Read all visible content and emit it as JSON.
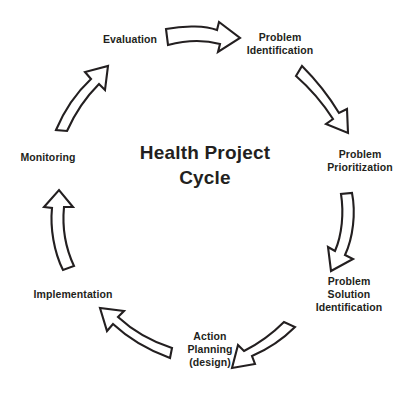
{
  "diagram": {
    "title_line1": "Health Project",
    "title_line2": "Cycle",
    "background_color": "#ffffff",
    "stroke_color": "#231f20",
    "text_color": "#231f20",
    "shape": "circular-cycle",
    "direction": "clockwise",
    "stage_count": 7,
    "arrow_count": 7,
    "stages": [
      {
        "id": "evaluation",
        "label": "Evaluation",
        "lines": [
          "Evaluation"
        ],
        "position": "top-left",
        "order": 7
      },
      {
        "id": "problem-identification",
        "label": "Problem Identification",
        "lines": [
          "Problem",
          "Identification"
        ],
        "position": "top-right",
        "order": 1
      },
      {
        "id": "problem-prioritization",
        "label": "Problem Prioritization",
        "lines": [
          "Problem",
          "Prioritization"
        ],
        "position": "right",
        "order": 2
      },
      {
        "id": "problem-solution-identification",
        "label": "Problem Solution Identification",
        "lines": [
          "Problem",
          "Solution",
          "Identification"
        ],
        "position": "bottom-right",
        "order": 3
      },
      {
        "id": "action-planning",
        "label": "Action Planning (design)",
        "lines": [
          "Action",
          "Planning",
          "(design)"
        ],
        "position": "bottom",
        "order": 4
      },
      {
        "id": "implementation",
        "label": "Implementation",
        "lines": [
          "Implementation"
        ],
        "position": "bottom-left",
        "order": 5
      },
      {
        "id": "monitoring",
        "label": "Monitoring",
        "lines": [
          "Monitoring"
        ],
        "position": "left",
        "order": 6
      }
    ],
    "arrows": [
      {
        "id": "arrow-evaluation-to-problem-identification",
        "from": "evaluation",
        "to": "problem-identification",
        "direction": "right"
      },
      {
        "id": "arrow-problem-identification-to-problem-prioritization",
        "from": "problem-identification",
        "to": "problem-prioritization",
        "direction": "down-right"
      },
      {
        "id": "arrow-problem-prioritization-to-problem-solution-identification",
        "from": "problem-prioritization",
        "to": "problem-solution-identification",
        "direction": "down"
      },
      {
        "id": "arrow-problem-solution-identification-to-action-planning",
        "from": "problem-solution-identification",
        "to": "action-planning",
        "direction": "down-left"
      },
      {
        "id": "arrow-action-planning-to-implementation",
        "from": "action-planning",
        "to": "implementation",
        "direction": "up-left"
      },
      {
        "id": "arrow-implementation-to-monitoring",
        "from": "implementation",
        "to": "monitoring",
        "direction": "up"
      },
      {
        "id": "arrow-monitoring-to-evaluation",
        "from": "monitoring",
        "to": "evaluation",
        "direction": "up-right"
      }
    ]
  }
}
